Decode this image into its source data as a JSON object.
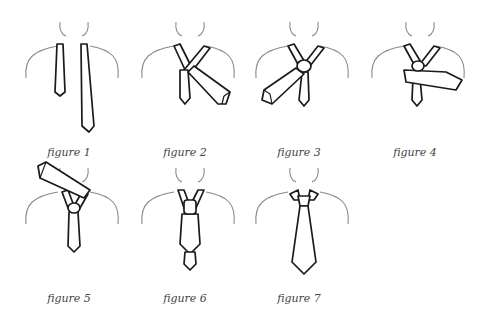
{
  "figures": [
    {
      "id": 1,
      "caption": "figure 1"
    },
    {
      "id": 2,
      "caption": "figure 2"
    },
    {
      "id": 3,
      "caption": "figure 3"
    },
    {
      "id": 4,
      "caption": "figure 4"
    },
    {
      "id": 5,
      "caption": "figure 5"
    },
    {
      "id": 6,
      "caption": "figure 6"
    },
    {
      "id": 7,
      "caption": "figure 7"
    }
  ]
}
